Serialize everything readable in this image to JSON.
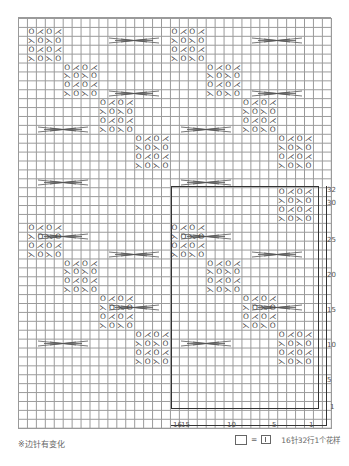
{
  "chart": {
    "grid": {
      "columns": 35,
      "rows": 46,
      "cell_px": 9
    },
    "symbols": {
      "yo_k2tog_pair_a": [
        "O",
        "⋌",
        "O",
        "⋌"
      ],
      "yo_k2tog_pair_b": [
        "⋋",
        "O",
        "⋋",
        "O"
      ],
      "cable_cross": "cable-cross"
    },
    "row_numbers": [
      "32",
      "30",
      "25",
      "20",
      "15",
      "10",
      "5",
      "1"
    ],
    "column_numbers": [
      "16",
      "15",
      "10",
      "5",
      "1"
    ],
    "footnote": "※边针有变化",
    "legend": {
      "equals": "=",
      "description": "16针32行1个花样"
    },
    "colors": {
      "grid": "#9a9a9a",
      "outline": "#333333",
      "symbol": "#444444"
    }
  },
  "motifs": [
    {
      "type": "a",
      "col": 8,
      "row": 1
    },
    {
      "type": "b",
      "col": 8,
      "row": 2
    },
    {
      "type": "a",
      "col": 8,
      "row": 3
    },
    {
      "type": "b",
      "col": 8,
      "row": 4
    },
    {
      "type": "a",
      "col": 24,
      "row": 1
    },
    {
      "type": "b",
      "col": 24,
      "row": 2
    },
    {
      "type": "a",
      "col": 24,
      "row": 3
    },
    {
      "type": "b",
      "col": 24,
      "row": 4
    }
  ]
}
